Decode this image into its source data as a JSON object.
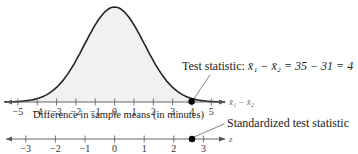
{
  "chart_data": [
    {
      "type": "area",
      "title": "",
      "description": "Normal sampling distribution of the difference in sample means, shaded under curve",
      "xlabel": "Difference in sample means (in minutes)",
      "x_variable": "x̄1 − x̄2",
      "ylabel": "",
      "xlim": [
        -5.5,
        5.5
      ],
      "ticks": [
        -5,
        -4,
        -3,
        -2,
        -1,
        0,
        1,
        2,
        3,
        4,
        5
      ],
      "tick_labels": [
        "−5",
        "−4",
        "−3",
        "−2",
        "−1",
        "0",
        "1",
        "2",
        "3",
        "4",
        "5"
      ],
      "curve": {
        "mean": 0,
        "sd": 1.55,
        "fill": "#f2f2f2",
        "stroke": "#222222"
      },
      "marked_point": {
        "x": 4,
        "label": "Test statistic: x̄1 − x̄2 = 35 − 31 = 4"
      },
      "grid": false
    },
    {
      "type": "scatter",
      "title": "",
      "description": "Standard normal z number line with standardized test statistic",
      "xlabel": "",
      "x_variable": "z",
      "xlim": [
        -3.5,
        3.5
      ],
      "ticks": [
        -3,
        -2,
        -1,
        0,
        1,
        2,
        3
      ],
      "tick_labels": [
        "−3",
        "−2",
        "−1",
        "0",
        "1",
        "2",
        "3"
      ],
      "marked_point": {
        "x": 2.6,
        "label": "Standardized test statistic"
      },
      "grid": false
    }
  ],
  "top_axis": {
    "caption": "Difference in sample means (in minutes)",
    "var_label": "x̄₁ − x̄₂",
    "ticks": [
      "−5",
      "−4",
      "−3",
      "−2",
      "−1",
      "0",
      "1",
      "2",
      "3",
      "4",
      "5"
    ]
  },
  "bottom_axis": {
    "var_label": "z",
    "ticks": [
      "−3",
      "−2",
      "−1",
      "0",
      "1",
      "2",
      "3"
    ]
  },
  "annotations": {
    "test_statistic_prefix": "Test statistic: ",
    "test_statistic_expr": "x̄₁ − x̄₂ = 35 − 31 = 4",
    "standardized": "Standardized test statistic"
  }
}
